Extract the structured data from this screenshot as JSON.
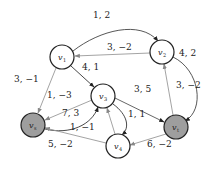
{
  "diagram": {
    "type": "directed-graph",
    "nodes": [
      {
        "id": "v1",
        "label": "v",
        "sub": "1",
        "x": 62,
        "y": 57,
        "filled": false
      },
      {
        "id": "v2",
        "label": "v",
        "sub": "2",
        "x": 162,
        "y": 52,
        "filled": false
      },
      {
        "id": "v3",
        "label": "v",
        "sub": "3",
        "x": 103,
        "y": 96,
        "filled": false
      },
      {
        "id": "vs",
        "label": "v",
        "sub": "s",
        "x": 33,
        "y": 125,
        "filled": true
      },
      {
        "id": "vt",
        "label": "v",
        "sub": "t",
        "x": 176,
        "y": 127,
        "filled": true
      },
      {
        "id": "v4",
        "label": "v",
        "sub": "4",
        "x": 118,
        "y": 146,
        "filled": false
      }
    ],
    "edges": [
      {
        "from": "v1",
        "to": "v2",
        "label": "1, 2",
        "lx": 93,
        "ly": 18
      },
      {
        "from": "v2",
        "to": "v1",
        "label": "3, −2",
        "lx": 107,
        "ly": 50
      },
      {
        "from": "v1",
        "to": "v3",
        "label": "4, 1",
        "lx": 82,
        "ly": 70
      },
      {
        "from": "v1",
        "to": "vs",
        "label": "3, −1",
        "lx": 14,
        "ly": 82
      },
      {
        "from": "v3",
        "to": "vs",
        "label": "1, −3",
        "lx": 47,
        "ly": 98
      },
      {
        "from": "vs",
        "to": "v3",
        "label": "7, 3",
        "lx": 62,
        "ly": 116
      },
      {
        "from": "v3",
        "to": "vt",
        "label": "3, 5",
        "lx": 134,
        "ly": 92
      },
      {
        "from": "vt",
        "to": "v2",
        "label": "3, −2",
        "lx": 176,
        "ly": 88
      },
      {
        "from": "v2",
        "to": "vt",
        "label": "4, 2",
        "lx": 179,
        "ly": 56
      },
      {
        "from": "v4",
        "to": "v3",
        "label": "1, −1",
        "lx": 70,
        "ly": 130
      },
      {
        "from": "v3",
        "to": "v4",
        "label": "1, 1",
        "lx": 128,
        "ly": 117
      },
      {
        "from": "v4",
        "to": "vs",
        "label": "5, −2",
        "lx": 48,
        "ly": 147
      },
      {
        "from": "vt",
        "to": "v4",
        "label": "6, −2",
        "lx": 147,
        "ly": 147
      }
    ],
    "colors": {
      "edge": "#777777",
      "node_stroke": "#222222",
      "filled": "#9e9e9e",
      "empty": "#ffffff"
    }
  }
}
